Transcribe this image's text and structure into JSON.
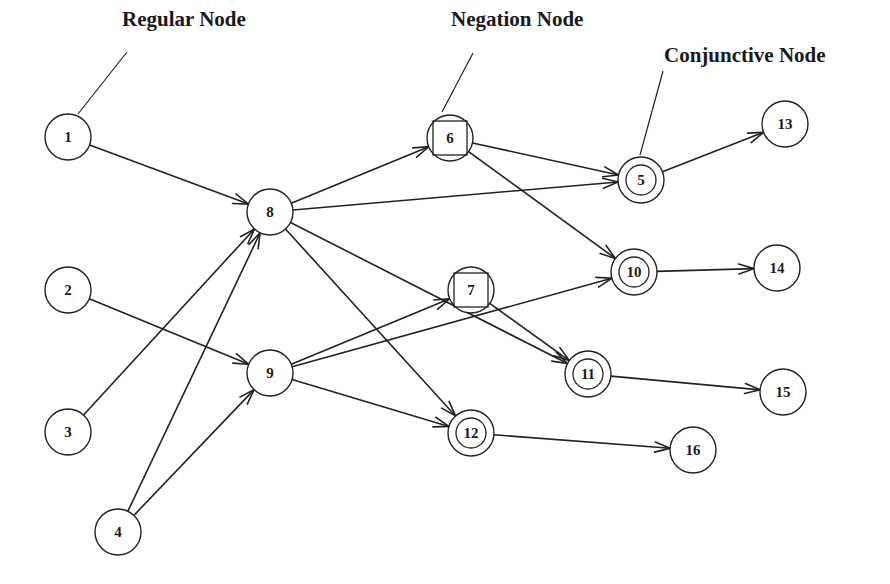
{
  "diagram": {
    "type": "directed-graph",
    "legend": [
      {
        "id": "regular",
        "label": "Regular Node",
        "x": 122,
        "y": 26,
        "leader": [
          78,
          114,
          127,
          52
        ]
      },
      {
        "id": "negation",
        "label": "Negation Node",
        "x": 451,
        "y": 26,
        "leader": [
          442,
          112,
          473,
          53
        ]
      },
      {
        "id": "conjunctive",
        "label": "Conjunctive Node",
        "x": 664,
        "y": 62,
        "leader": [
          640,
          155,
          663,
          71
        ]
      }
    ],
    "nodes": [
      {
        "id": "1",
        "label": "1",
        "type": "regular",
        "x": 68,
        "y": 137
      },
      {
        "id": "2",
        "label": "2",
        "type": "regular",
        "x": 68,
        "y": 290
      },
      {
        "id": "3",
        "label": "3",
        "type": "regular",
        "x": 68,
        "y": 432
      },
      {
        "id": "4",
        "label": "4",
        "type": "regular",
        "x": 118,
        "y": 532
      },
      {
        "id": "8",
        "label": "8",
        "type": "regular",
        "x": 270,
        "y": 212
      },
      {
        "id": "9",
        "label": "9",
        "type": "regular",
        "x": 270,
        "y": 373
      },
      {
        "id": "6",
        "label": "6",
        "type": "negation",
        "x": 450,
        "y": 138
      },
      {
        "id": "7",
        "label": "7",
        "type": "negation",
        "x": 471,
        "y": 290
      },
      {
        "id": "5",
        "label": "5",
        "type": "conjunctive",
        "x": 641,
        "y": 180
      },
      {
        "id": "10",
        "label": "10",
        "type": "conjunctive",
        "x": 634,
        "y": 272
      },
      {
        "id": "11",
        "label": "11",
        "type": "conjunctive",
        "x": 588,
        "y": 374
      },
      {
        "id": "12",
        "label": "12",
        "type": "conjunctive",
        "x": 471,
        "y": 433
      },
      {
        "id": "13",
        "label": "13",
        "type": "regular",
        "x": 785,
        "y": 124
      },
      {
        "id": "14",
        "label": "14",
        "type": "regular",
        "x": 777,
        "y": 268
      },
      {
        "id": "15",
        "label": "15",
        "type": "regular",
        "x": 783,
        "y": 392
      },
      {
        "id": "16",
        "label": "16",
        "type": "regular",
        "x": 693,
        "y": 450
      }
    ],
    "edges": [
      {
        "from": "1",
        "to": "8"
      },
      {
        "from": "2",
        "to": "9"
      },
      {
        "from": "3",
        "to": "8"
      },
      {
        "from": "4",
        "to": "8"
      },
      {
        "from": "4",
        "to": "9"
      },
      {
        "from": "8",
        "to": "6"
      },
      {
        "from": "8",
        "to": "5"
      },
      {
        "from": "8",
        "to": "11"
      },
      {
        "from": "8",
        "to": "12"
      },
      {
        "from": "9",
        "to": "7"
      },
      {
        "from": "9",
        "to": "10"
      },
      {
        "from": "9",
        "to": "12"
      },
      {
        "from": "6",
        "to": "5"
      },
      {
        "from": "6",
        "to": "10"
      },
      {
        "from": "7",
        "to": "11"
      },
      {
        "from": "5",
        "to": "13"
      },
      {
        "from": "10",
        "to": "14"
      },
      {
        "from": "11",
        "to": "15"
      },
      {
        "from": "12",
        "to": "16"
      }
    ],
    "style": {
      "node_radius": 23,
      "inner_radius": 15,
      "square_half": 17,
      "stroke_color": "#222222",
      "background": "#ffffff"
    }
  }
}
